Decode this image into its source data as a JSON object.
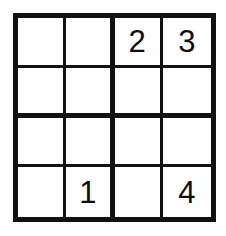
{
  "puzzle": {
    "type": "sudoku-4x4",
    "title": "4x4 Sudoku Grid",
    "rows": 4,
    "columns": 4,
    "box_rows": 2,
    "box_columns": 2,
    "colors": {
      "line": "#111111",
      "digit": "#0d0d0d",
      "cell_background": "#ffffff",
      "page_background": "#ffffff"
    },
    "cells": [
      {
        "row": 1,
        "column": 1,
        "value": "",
        "empty": true
      },
      {
        "row": 1,
        "column": 2,
        "value": "",
        "empty": true
      },
      {
        "row": 1,
        "column": 3,
        "value": "2",
        "empty": false
      },
      {
        "row": 1,
        "column": 4,
        "value": "3",
        "empty": false
      },
      {
        "row": 2,
        "column": 1,
        "value": "",
        "empty": true
      },
      {
        "row": 2,
        "column": 2,
        "value": "",
        "empty": true
      },
      {
        "row": 2,
        "column": 3,
        "value": "",
        "empty": true
      },
      {
        "row": 2,
        "column": 4,
        "value": "",
        "empty": true
      },
      {
        "row": 3,
        "column": 1,
        "value": "",
        "empty": true
      },
      {
        "row": 3,
        "column": 2,
        "value": "",
        "empty": true
      },
      {
        "row": 3,
        "column": 3,
        "value": "",
        "empty": true
      },
      {
        "row": 3,
        "column": 4,
        "value": "",
        "empty": true
      },
      {
        "row": 4,
        "column": 1,
        "value": "",
        "empty": true
      },
      {
        "row": 4,
        "column": 2,
        "value": "1",
        "empty": false
      },
      {
        "row": 4,
        "column": 3,
        "value": "",
        "empty": true
      },
      {
        "row": 4,
        "column": 4,
        "value": "4",
        "empty": false
      }
    ]
  }
}
